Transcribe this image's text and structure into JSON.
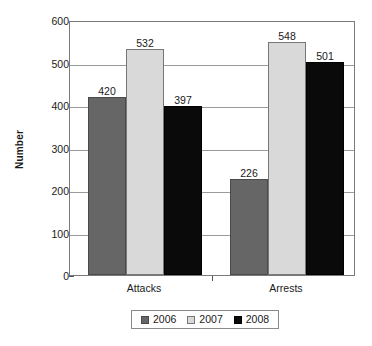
{
  "chart_data": {
    "type": "bar",
    "title": "",
    "xlabel": "",
    "ylabel": "Number",
    "categories": [
      "Attacks",
      "Arrests"
    ],
    "series": [
      {
        "name": "2006",
        "values": [
          420,
          397
        ],
        "color": "#666666"
      },
      {
        "name": "2007",
        "values": [
          532,
          548
        ],
        "color": "#d9d9d9"
      },
      {
        "name": "2008",
        "values": [
          397,
          501
        ],
        "color": "#0a0a0a"
      }
    ],
    "series_corrected": [
      {
        "name": "2006",
        "values": [
          420,
          226
        ],
        "color": "#666666"
      },
      {
        "name": "2007",
        "values": [
          532,
          548
        ],
        "color": "#d9d9d9"
      },
      {
        "name": "2008",
        "values": [
          397,
          501
        ],
        "color": "#0a0a0a"
      }
    ],
    "data_labels": {
      "Attacks": {
        "2006": "420",
        "2007": "532",
        "2008": "397"
      },
      "Arrests": {
        "2006": "226",
        "2007": "548",
        "2008": "501"
      }
    },
    "ylim": [
      0,
      600
    ],
    "yticks": [
      0,
      100,
      200,
      300,
      400,
      500,
      600
    ],
    "ytick_labels": [
      "0",
      "100",
      "200",
      "300",
      "400",
      "500",
      "600"
    ],
    "grid": true,
    "legend_position": "bottom"
  },
  "axis": {
    "y_title": "Number",
    "y_ticks": [
      {
        "value": 600,
        "label": "600"
      },
      {
        "value": 500,
        "label": "500"
      },
      {
        "value": 400,
        "label": "400"
      },
      {
        "value": 300,
        "label": "300"
      },
      {
        "value": 200,
        "label": "200"
      },
      {
        "value": 100,
        "label": "100"
      },
      {
        "value": 0,
        "label": "0"
      }
    ],
    "x_categories": [
      {
        "label": "Attacks"
      },
      {
        "label": "Arrests"
      }
    ]
  },
  "bars": [
    {
      "group": "Attacks",
      "series": "2006",
      "value": 420,
      "label": "420",
      "class": "s2006"
    },
    {
      "group": "Attacks",
      "series": "2007",
      "value": 532,
      "label": "532",
      "class": "s2007"
    },
    {
      "group": "Attacks",
      "series": "2008",
      "value": 397,
      "label": "397",
      "class": "s2008"
    },
    {
      "group": "Arrests",
      "series": "2006",
      "value": 226,
      "label": "226",
      "class": "s2006"
    },
    {
      "group": "Arrests",
      "series": "2007",
      "value": 548,
      "label": "548",
      "class": "s2007"
    },
    {
      "group": "Arrests",
      "series": "2008",
      "value": 501,
      "label": "501",
      "class": "s2008"
    }
  ],
  "legend": {
    "items": [
      {
        "label": "2006",
        "color": "#666666",
        "class": "s2006"
      },
      {
        "label": "2007",
        "color": "#d9d9d9",
        "class": "s2007"
      },
      {
        "label": "2008",
        "color": "#0a0a0a",
        "class": "s2008"
      }
    ]
  }
}
